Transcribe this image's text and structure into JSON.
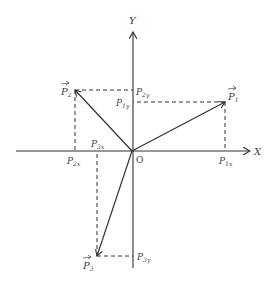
{
  "diagram": {
    "axes": {
      "x_label": "X",
      "y_label": "Y",
      "origin_label": "O"
    },
    "vectors": [
      {
        "name": "P",
        "sub": "1",
        "tip": [
          225,
          102
        ]
      },
      {
        "name": "P",
        "sub": "2",
        "tip": [
          75,
          90
        ]
      },
      {
        "name": "P",
        "sub": "3",
        "tip": [
          97,
          256
        ]
      }
    ],
    "projection_labels": {
      "p1x": {
        "name": "P",
        "sub": "1x"
      },
      "p1y": {
        "name": "P",
        "sub": "1y"
      },
      "p2x": {
        "name": "P",
        "sub": "2x"
      },
      "p2y": {
        "name": "P",
        "sub": "2y"
      },
      "p3x": {
        "name": "P",
        "sub": "3x"
      },
      "p3y": {
        "name": "P",
        "sub": "3y"
      }
    },
    "colors": {
      "line": "#333333",
      "text": "#444444"
    }
  }
}
